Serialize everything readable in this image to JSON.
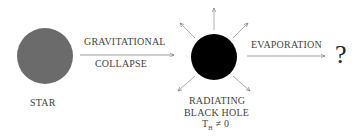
{
  "diagram": {
    "nodes": [
      {
        "id": "star",
        "label": "STAR",
        "shape": "circle",
        "fill": "#6b6b6b"
      },
      {
        "id": "black_hole",
        "label_lines": [
          "RADIATING",
          "BLACK HOLE",
          "T_H ≠ 0"
        ],
        "shape": "circle",
        "fill": "#000000",
        "radiating_arrows": 8
      },
      {
        "id": "unknown",
        "label": "?"
      }
    ],
    "edges": [
      {
        "from": "star",
        "to": "black_hole",
        "label_top": "GRAVITATIONAL",
        "label_bottom": "COLLAPSE"
      },
      {
        "from": "black_hole",
        "to": "unknown",
        "label_top": "EVAPORATION"
      }
    ]
  },
  "labels": {
    "star": "STAR",
    "collapse_top": "GRAVITATIONAL",
    "collapse_bottom": "COLLAPSE",
    "evaporation": "EVAPORATION",
    "bh_line1": "RADIATING",
    "bh_line2": "BLACK HOLE",
    "bh_temp_T": "T",
    "bh_temp_sub": "H",
    "bh_temp_rest": " ≠ 0",
    "question": "?"
  }
}
